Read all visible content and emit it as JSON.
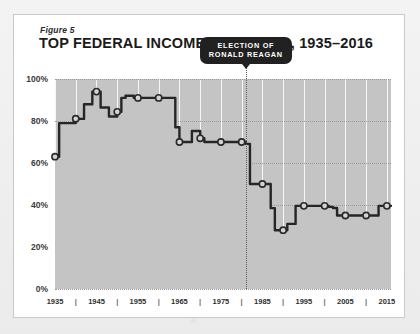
{
  "figure": {
    "label": "Figure 5",
    "title": "TOP FEDERAL INCOME TAX RATES, 1935–2016"
  },
  "colors": {
    "card_background": "#ffffff",
    "card_border": "#c9c9c9",
    "page_background": "#efefef",
    "area_fill": "#c4c4c4",
    "line": "#262626",
    "marker_fill": "#d4d4d4",
    "marker_stroke": "#2a2a2a",
    "gridline": "#9a9a9a",
    "callout_background": "#212121",
    "callout_text": "#ffffff"
  },
  "annotation": {
    "text_line1": "ELECTION OF",
    "text_line2": "RONALD REAGAN",
    "year": 1981
  },
  "chart_data": {
    "type": "area",
    "title": "TOP FEDERAL INCOME TAX RATES, 1935–2016",
    "subtitle": "Figure 5",
    "xlabel": "",
    "ylabel": "",
    "xlim": [
      1935,
      2016
    ],
    "ylim": [
      0,
      100
    ],
    "yticks": [
      0,
      20,
      40,
      60,
      80,
      100
    ],
    "yticklabels": [
      "0%",
      "20%",
      "40%",
      "60%",
      "80%",
      "100%"
    ],
    "xticks": [
      1935,
      1945,
      1955,
      1965,
      1975,
      1985,
      1995,
      2005,
      2015
    ],
    "xticklabels": [
      "1935",
      "1945",
      "1955",
      "1965",
      "1975",
      "1985",
      "1995",
      "2005",
      "2015"
    ],
    "xminorticks": [
      1940,
      1950,
      1960,
      1970,
      1980,
      1990,
      2000,
      2010
    ],
    "grid": "horizontal-dotted",
    "legend": "none",
    "step": true,
    "marker_interval_years": 5,
    "series": [
      {
        "name": "Top federal marginal income tax rate",
        "units": "percent",
        "x": [
          1935,
          1936,
          1940,
          1941,
          1942,
          1944,
          1946,
          1948,
          1950,
          1951,
          1952,
          1954,
          1964,
          1965,
          1968,
          1970,
          1971,
          1981,
          1982,
          1987,
          1988,
          1991,
          1993,
          2001,
          2002,
          2003,
          2013,
          2016
        ],
        "values": [
          63,
          79,
          81.1,
          81,
          88,
          94,
          86.45,
          82.13,
          84.36,
          91,
          92,
          91,
          77,
          70,
          75.25,
          71.75,
          70,
          69.13,
          50,
          38.5,
          28,
          31,
          39.6,
          39.1,
          38.6,
          35,
          39.6,
          39.6
        ]
      }
    ],
    "markers": {
      "x": [
        1935,
        1940,
        1945,
        1950,
        1955,
        1960,
        1965,
        1970,
        1975,
        1980,
        1985,
        1990,
        1995,
        2000,
        2005,
        2010,
        2015
      ],
      "values": [
        63,
        81.1,
        94,
        84.36,
        91,
        91,
        70,
        71.75,
        70,
        70,
        50,
        28,
        39.6,
        39.6,
        35,
        35,
        39.6
      ]
    },
    "annotations": [
      {
        "year": 1981,
        "label": "ELECTION OF RONALD REAGAN"
      }
    ]
  },
  "axis": {
    "y_labels": [
      "100%",
      "80%",
      "60%",
      "40%",
      "20%",
      "0%"
    ],
    "x_labels": [
      "1935",
      "1945",
      "1955",
      "1965",
      "1975",
      "1985",
      "1995",
      "2005",
      "2015"
    ],
    "x_tick_glyph": "|"
  }
}
